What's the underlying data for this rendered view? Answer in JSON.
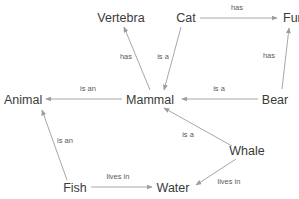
{
  "diagram": {
    "type": "knowledge-graph",
    "title": "",
    "colors": {
      "background": "#ffffff",
      "node_text": "#3a3a3a",
      "edge_label_text": "#5a5a5a",
      "edge_line": "#9d9d9d"
    },
    "nodes": [
      {
        "id": "vertebra",
        "label": "Vertebra",
        "x": 121,
        "y": 22,
        "anchor": "middle"
      },
      {
        "id": "cat",
        "label": "Cat",
        "x": 186,
        "y": 22,
        "anchor": "middle"
      },
      {
        "id": "fur",
        "label": "Fur",
        "x": 283,
        "y": 22,
        "anchor": "start"
      },
      {
        "id": "animal",
        "label": "Animal",
        "x": 4,
        "y": 104,
        "anchor": "start"
      },
      {
        "id": "mammal",
        "label": "Mammal",
        "x": 150,
        "y": 104,
        "anchor": "middle"
      },
      {
        "id": "bear",
        "label": "Bear",
        "x": 275,
        "y": 104,
        "anchor": "middle"
      },
      {
        "id": "whale",
        "label": "Whale",
        "x": 247,
        "y": 155,
        "anchor": "middle"
      },
      {
        "id": "fish",
        "label": "Fish",
        "x": 75,
        "y": 192,
        "anchor": "middle"
      },
      {
        "id": "water",
        "label": "Water",
        "x": 173,
        "y": 192,
        "anchor": "middle"
      }
    ],
    "edges": [
      {
        "id": "mammal-has-vertebra",
        "source": "mammal",
        "target": "vertebra",
        "label": "has",
        "x1": 150,
        "y1": 90,
        "x2": 124,
        "y2": 27,
        "lx": 126,
        "ly": 59,
        "anchor": "middle"
      },
      {
        "id": "cat-isa-mammal",
        "source": "cat",
        "target": "mammal",
        "label": "is a",
        "x1": 181,
        "y1": 27,
        "x2": 164,
        "y2": 90,
        "lx": 163,
        "ly": 59,
        "anchor": "middle"
      },
      {
        "id": "cat-has-fur",
        "source": "cat",
        "target": "fur",
        "label": "has",
        "x1": 200,
        "y1": 18,
        "x2": 277,
        "y2": 18,
        "lx": 237,
        "ly": 10,
        "anchor": "middle"
      },
      {
        "id": "bear-has-fur",
        "source": "bear",
        "target": "fur",
        "label": "has",
        "x1": 282,
        "y1": 89,
        "x2": 289,
        "y2": 28,
        "lx": 269,
        "ly": 58,
        "anchor": "middle"
      },
      {
        "id": "bear-isa-mammal",
        "source": "bear",
        "target": "mammal",
        "label": "is a",
        "x1": 258,
        "y1": 99,
        "x2": 182,
        "y2": 99,
        "lx": 219,
        "ly": 91,
        "anchor": "middle"
      },
      {
        "id": "mammal-isan-animal",
        "source": "mammal",
        "target": "animal",
        "label": "is an",
        "x1": 122,
        "y1": 99,
        "x2": 46,
        "y2": 99,
        "lx": 88,
        "ly": 91,
        "anchor": "middle"
      },
      {
        "id": "whale-isa-mammal",
        "source": "whale",
        "target": "mammal",
        "label": "is a",
        "x1": 232,
        "y1": 146,
        "x2": 164,
        "y2": 108,
        "lx": 188,
        "ly": 137,
        "anchor": "middle"
      },
      {
        "id": "whale-livesin-water",
        "source": "whale",
        "target": "water",
        "label": "lives in",
        "x1": 236,
        "y1": 159,
        "x2": 196,
        "y2": 185,
        "lx": 229,
        "ly": 184,
        "anchor": "middle"
      },
      {
        "id": "fish-isan-animal",
        "source": "fish",
        "target": "animal",
        "label": "is an",
        "x1": 67,
        "y1": 180,
        "x2": 42,
        "y2": 110,
        "lx": 65,
        "ly": 143,
        "anchor": "middle"
      },
      {
        "id": "fish-livesin-water",
        "source": "fish",
        "target": "water",
        "label": "lives in",
        "x1": 91,
        "y1": 187,
        "x2": 152,
        "y2": 187,
        "lx": 118,
        "ly": 179,
        "anchor": "middle"
      }
    ]
  }
}
